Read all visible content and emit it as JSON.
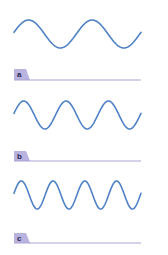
{
  "colors": {
    "wave": "#4f81c7",
    "tab": "#b9b3e0",
    "rule": "#a9a3d8",
    "label_text": "#2a2550"
  },
  "panels": [
    {
      "label": "a",
      "cycles": 2,
      "center_y": 34,
      "amplitude": 14,
      "tab_y": 69,
      "rule_y": 80
    },
    {
      "label": "b",
      "cycles": 3,
      "center_y": 115,
      "amplitude": 14,
      "tab_y": 151,
      "rule_y": 161
    },
    {
      "label": "c",
      "cycles": 4,
      "center_y": 195,
      "amplitude": 14,
      "tab_y": 233,
      "rule_y": 243
    }
  ],
  "wave_x_start": 14,
  "wave_x_end": 141
}
